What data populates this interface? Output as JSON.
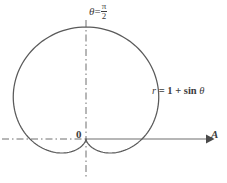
{
  "figure": {
    "background_color": "#ffffff",
    "ink_color": "#4a4a4a",
    "text_color": "#3d3d3d"
  },
  "labels": {
    "theta_axis": {
      "symbol": "θ",
      "equals": "=",
      "numerator": "π",
      "denominator": "2",
      "full_text": "θ = π/2"
    },
    "curve_equation": {
      "lhs": "r",
      "equals": "=",
      "rhs": "1 + sin",
      "variable": "θ",
      "full_text": "r = 1 + sin θ"
    },
    "origin": "0",
    "polar_axis": "A"
  },
  "chart_data": {
    "type": "line",
    "title": "",
    "subtitle": "",
    "xlabel": "A",
    "ylabel": "θ = π/2",
    "curve_name": "r = 1 + sin θ",
    "equation": "r = 1 + sin(theta)",
    "coordinate_system": "polar",
    "grid": false,
    "legend": "none",
    "annotations": [
      {
        "text": "θ = π/2",
        "position": "top-center",
        "refers_to": "vertical dash-dot axis"
      },
      {
        "text": "r = 1 + sin θ",
        "position": "right-middle",
        "refers_to": "cardioid curve"
      },
      {
        "text": "0",
        "position": "origin",
        "refers_to": "pole / origin"
      },
      {
        "text": "A",
        "position": "right-end",
        "refers_to": "polar axis arrow"
      }
    ],
    "axes": {
      "polar_axis": {
        "label": "A",
        "style": "dash-dot-left-solid-right",
        "arrow": true,
        "direction": "horizontal"
      },
      "theta_axis": {
        "label": "θ = π/2",
        "style": "dash-dot",
        "arrow": false,
        "direction": "vertical"
      }
    },
    "r_range": [
      0,
      2
    ],
    "theta_range_deg": [
      0,
      360
    ],
    "key_points": [
      {
        "theta_deg": 0,
        "r": 1,
        "note": "right intercept on polar axis"
      },
      {
        "theta_deg": 90,
        "r": 2,
        "note": "maximum radius, top of cardioid"
      },
      {
        "theta_deg": 180,
        "r": 1,
        "note": "left intercept on polar axis"
      },
      {
        "theta_deg": 270,
        "r": 0,
        "note": "cusp at the pole"
      }
    ],
    "series": [
      {
        "name": "r = 1 + sin θ",
        "theta_deg": [
          0,
          15,
          30,
          45,
          60,
          75,
          90,
          105,
          120,
          135,
          150,
          165,
          180,
          195,
          210,
          225,
          240,
          255,
          270,
          285,
          300,
          315,
          330,
          345,
          360
        ],
        "r": [
          1.0,
          1.259,
          1.5,
          1.707,
          1.866,
          1.966,
          2.0,
          1.966,
          1.866,
          1.707,
          1.5,
          1.259,
          1.0,
          0.741,
          0.5,
          0.293,
          0.134,
          0.034,
          0.0,
          0.034,
          0.134,
          0.293,
          0.5,
          0.741,
          1.0
        ]
      }
    ]
  },
  "geometry": {
    "pole_px": {
      "x": 86,
      "y": 139
    },
    "scale_px_per_unit": 56,
    "vertical_axis_x": 86,
    "vertical_axis_top": 20,
    "vertical_axis_bottom": 179,
    "horizontal_axis_y": 139,
    "horizontal_axis_left": 2,
    "horizontal_axis_right": 209
  }
}
